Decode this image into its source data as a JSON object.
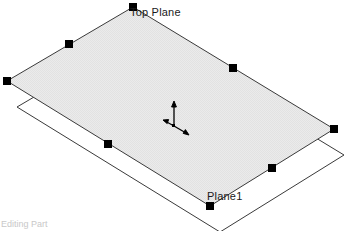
{
  "viewport": {
    "background_color": "#ffffff",
    "width": 348,
    "height": 231
  },
  "labels": {
    "top_plane": "Top Plane",
    "plane1": "Plane1"
  },
  "status_bar": {
    "text": "Editing Part"
  },
  "colors": {
    "plane_fill": "#e9e9e9",
    "plane_outline": "#3a3a3a",
    "handle_fill": "#000000",
    "triad_color": "#000000",
    "label_text": "#1a1a1a"
  },
  "geometry": {
    "top_plane": {
      "name": "Top Plane",
      "filled": true,
      "selected": true,
      "points": [
        [
          133,
          7
        ],
        [
          334,
          129
        ],
        [
          210,
          206
        ],
        [
          7,
          81
        ]
      ],
      "corner_handles": [
        [
          133,
          7
        ],
        [
          334,
          129
        ],
        [
          210,
          206
        ],
        [
          7,
          81
        ]
      ],
      "midpoint_handles": [
        [
          69,
          44
        ],
        [
          233,
          68
        ],
        [
          272,
          168
        ],
        [
          108,
          144
        ]
      ]
    },
    "plane1": {
      "name": "Plane1",
      "filled": false,
      "selected": false,
      "points": [
        [
          143,
          33
        ],
        [
          344,
          155
        ],
        [
          220,
          232
        ],
        [
          17,
          107
        ]
      ]
    },
    "triad": {
      "origin": [
        174,
        126
      ],
      "axes": [
        {
          "name": "y-axis-up",
          "to": [
            174,
            103
          ]
        },
        {
          "name": "x-axis-right",
          "to": [
            187,
            134
          ]
        },
        {
          "name": "z-axis-left",
          "to": [
            166,
            122
          ]
        }
      ]
    }
  }
}
